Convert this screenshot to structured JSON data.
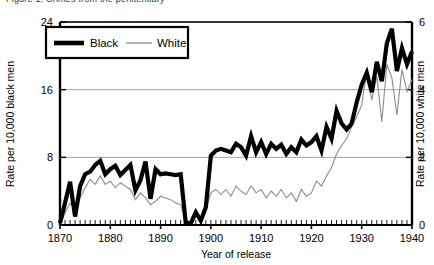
{
  "figure": {
    "caption": "Figure 1.  Crimes from the penitentiary"
  },
  "chart_data": {
    "type": "line",
    "title": "",
    "xlabel": "Year of release",
    "ylabel": "Rate per 10,000 black men",
    "y2label": "Rate per 10,000 white men",
    "xlim": [
      1870,
      1940
    ],
    "ylim": [
      0,
      24
    ],
    "y2lim": [
      0,
      6
    ],
    "xticks": [
      1870,
      1880,
      1890,
      1900,
      1910,
      1920,
      1930,
      1940
    ],
    "yticks": [
      0,
      8,
      16,
      24
    ],
    "y2ticks": [
      0,
      2,
      4,
      6
    ],
    "grid": "horizontal",
    "minor_xticks_interval": 1,
    "legend": {
      "position": "top-left-inside",
      "entries": [
        {
          "label": "Black",
          "color": "#000000",
          "width": 4.2,
          "axis": "left"
        },
        {
          "label": "White",
          "color": "#8c8c8c",
          "width": 1.1,
          "axis": "right"
        }
      ]
    },
    "series": [
      {
        "name": "Black",
        "axis": "left",
        "color": "#000000",
        "linewidth": 4.2,
        "x": [
          1870,
          1871,
          1872,
          1873,
          1874,
          1875,
          1876,
          1877,
          1878,
          1879,
          1880,
          1881,
          1882,
          1883,
          1884,
          1885,
          1886,
          1887,
          1888,
          1889,
          1890,
          1891,
          1892,
          1893,
          1894,
          1895,
          1896,
          1897,
          1898,
          1899,
          1900,
          1901,
          1902,
          1903,
          1904,
          1905,
          1906,
          1907,
          1908,
          1909,
          1910,
          1911,
          1912,
          1913,
          1914,
          1915,
          1916,
          1917,
          1918,
          1919,
          1920,
          1921,
          1922,
          1923,
          1924,
          1925,
          1926,
          1927,
          1928,
          1929,
          1930,
          1931,
          1932,
          1933,
          1934,
          1935,
          1936,
          1937,
          1938,
          1939,
          1940
        ],
        "y": [
          0.2,
          2.6,
          5.1,
          1.0,
          4.6,
          6.0,
          6.3,
          7.1,
          7.6,
          6.0,
          6.6,
          7.0,
          5.9,
          6.5,
          7.1,
          4.1,
          5.3,
          7.5,
          3.1,
          6.6,
          6.0,
          6.1,
          6.0,
          5.9,
          6.0,
          0.3,
          0.2,
          1.5,
          0.5,
          2.1,
          8.2,
          8.8,
          9.0,
          8.8,
          8.6,
          9.6,
          9.2,
          8.2,
          10.5,
          8.6,
          9.8,
          8.4,
          9.6,
          9.0,
          9.5,
          8.4,
          9.2,
          8.6,
          10.1,
          9.4,
          9.8,
          10.5,
          8.8,
          11.6,
          10.2,
          13.5,
          12.0,
          11.3,
          12.0,
          14.5,
          16.6,
          18.0,
          15.7,
          19.3,
          17.0,
          21.5,
          23.2,
          18.2,
          20.9,
          19.0,
          20.5
        ]
      },
      {
        "name": "White",
        "axis": "right",
        "color": "#8c8c8c",
        "linewidth": 1.1,
        "x": [
          1870,
          1871,
          1872,
          1873,
          1874,
          1875,
          1876,
          1877,
          1878,
          1879,
          1880,
          1881,
          1882,
          1883,
          1884,
          1885,
          1886,
          1887,
          1888,
          1889,
          1890,
          1891,
          1892,
          1893,
          1894,
          1895,
          1896,
          1897,
          1898,
          1899,
          1900,
          1901,
          1902,
          1903,
          1904,
          1905,
          1906,
          1907,
          1908,
          1909,
          1910,
          1911,
          1912,
          1913,
          1914,
          1915,
          1916,
          1917,
          1918,
          1919,
          1920,
          1921,
          1922,
          1923,
          1924,
          1925,
          1926,
          1927,
          1928,
          1929,
          1930,
          1931,
          1932,
          1933,
          1934,
          1935,
          1936,
          1937,
          1938,
          1939,
          1940
        ],
        "y": [
          0.05,
          0.35,
          0.65,
          0.45,
          0.8,
          1.1,
          1.35,
          1.2,
          1.45,
          1.2,
          1.3,
          1.1,
          1.25,
          1.15,
          1.05,
          0.75,
          0.95,
          0.8,
          0.6,
          0.7,
          0.85,
          0.8,
          0.75,
          0.65,
          0.6,
          0.1,
          0.08,
          0.3,
          0.18,
          0.45,
          0.95,
          1.05,
          0.9,
          1.05,
          0.85,
          1.15,
          1.0,
          0.9,
          1.15,
          0.95,
          1.05,
          0.8,
          1.0,
          0.85,
          1.05,
          0.8,
          0.95,
          0.7,
          1.05,
          0.85,
          0.95,
          1.3,
          1.15,
          1.45,
          1.7,
          2.1,
          2.35,
          2.55,
          2.9,
          3.2,
          3.55,
          4.55,
          3.7,
          4.4,
          3.05,
          4.75,
          4.35,
          3.25,
          4.6,
          3.95,
          4.3
        ]
      }
    ]
  }
}
